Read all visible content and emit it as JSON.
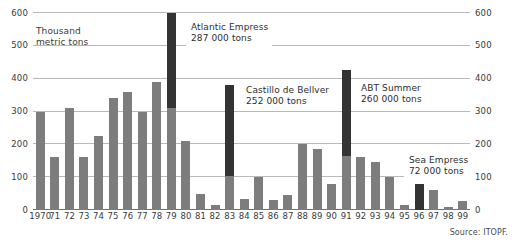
{
  "axis_title": "Thousand\nmetric tons",
  "source": "Source: ITOPF.",
  "colors": {
    "bar": "#7d7d7d",
    "bar_highlight": "#333333",
    "grid": "#b9b9b9",
    "text": "#3a3a3a"
  },
  "callouts": [
    {
      "id": "atlantic",
      "name": "Atlantic Empress",
      "value": "287 000 tons",
      "year": "79"
    },
    {
      "id": "castillo",
      "name": "Castillo de Bellver",
      "value": "252 000 tons",
      "year": "83"
    },
    {
      "id": "abt",
      "name": "ABT Summer",
      "value": "260 000 tons",
      "year": "91"
    },
    {
      "id": "sea",
      "name": "Sea Empress",
      "value": "72 000 tons",
      "year": "96"
    }
  ],
  "chart_data": {
    "type": "bar",
    "title": "",
    "xlabel": "",
    "ylabel": "Thousand metric tons",
    "ylim": [
      0,
      600
    ],
    "yticks": [
      0,
      100,
      200,
      300,
      400,
      500,
      600
    ],
    "ytick_labels": [
      "0",
      "100",
      "200",
      "300",
      "400",
      "500",
      "600"
    ],
    "grid": true,
    "legend": "none",
    "dual_axis": true,
    "categories": [
      "1970",
      "71",
      "72",
      "73",
      "74",
      "75",
      "76",
      "77",
      "78",
      "79",
      "80",
      "81",
      "82",
      "83",
      "84",
      "85",
      "86",
      "87",
      "88",
      "89",
      "90",
      "91",
      "92",
      "93",
      "94",
      "95",
      "96",
      "97",
      "98",
      "99"
    ],
    "values": [
      300,
      160,
      310,
      160,
      225,
      340,
      360,
      300,
      390,
      600,
      210,
      50,
      15,
      380,
      35,
      100,
      30,
      45,
      200,
      185,
      80,
      425,
      160,
      145,
      100,
      15,
      80,
      60,
      10,
      28
    ],
    "series": [
      {
        "name": "Quantity of oil spilt (excluding major single incident)",
        "color": "#7d7d7d",
        "values": [
          300,
          160,
          310,
          160,
          225,
          340,
          360,
          300,
          390,
          310,
          210,
          50,
          15,
          105,
          35,
          100,
          30,
          45,
          200,
          185,
          80,
          165,
          160,
          145,
          100,
          15,
          0,
          60,
          10,
          28
        ]
      },
      {
        "name": "Major single incident contribution",
        "color": "#333333",
        "base": [
          null,
          null,
          null,
          null,
          null,
          null,
          null,
          null,
          null,
          310,
          null,
          null,
          null,
          105,
          null,
          null,
          null,
          null,
          null,
          null,
          null,
          165,
          null,
          null,
          null,
          null,
          0,
          null,
          null,
          null
        ],
        "values": [
          null,
          null,
          null,
          null,
          null,
          null,
          null,
          null,
          null,
          600,
          null,
          null,
          null,
          380,
          null,
          null,
          null,
          null,
          null,
          null,
          null,
          425,
          null,
          null,
          null,
          null,
          80,
          null,
          null,
          null
        ]
      }
    ],
    "annotations": [
      {
        "label": "Atlantic Empress",
        "sublabel": "287 000 tons",
        "year": "79"
      },
      {
        "label": "Castillo de Bellver",
        "sublabel": "252 000 tons",
        "year": "83"
      },
      {
        "label": "ABT Summer",
        "sublabel": "260 000 tons",
        "year": "91"
      },
      {
        "label": "Sea Empress",
        "sublabel": "72 000 tons",
        "year": "96"
      }
    ]
  }
}
